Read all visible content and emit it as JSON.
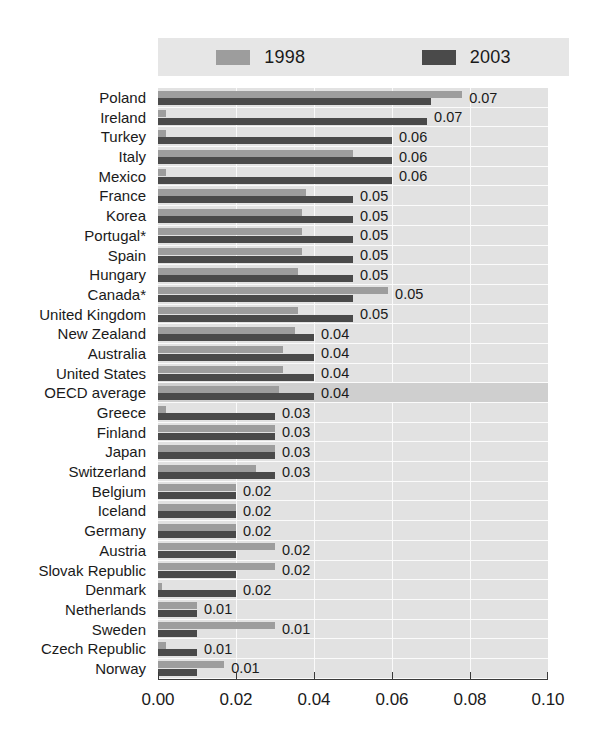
{
  "legend": {
    "entries": [
      {
        "label": "1998",
        "color": "#9d9d9d",
        "icon": "legend-swatch-icon"
      },
      {
        "label": "2003",
        "color": "#4a4a4a",
        "icon": "legend-swatch-icon"
      }
    ]
  },
  "axis": {
    "tick_labels": [
      "0.00",
      "0.02",
      "0.04",
      "0.06",
      "0.08",
      "0.10"
    ]
  },
  "chart_data": {
    "type": "bar",
    "orientation": "horizontal",
    "title": "",
    "subtitle": "",
    "xlabel": "",
    "ylabel": "",
    "xlim": [
      0.0,
      0.1
    ],
    "grid": true,
    "gridlines_at": [
      0.02,
      0.04,
      0.06,
      0.08
    ],
    "legend_position": "top",
    "highlight_category": "OECD average",
    "categories": [
      "Poland",
      "Ireland",
      "Turkey",
      "Italy",
      "Mexico",
      "France",
      "Korea",
      "Portugal*",
      "Spain",
      "Hungary",
      "Canada*",
      "United Kingdom",
      "New Zealand",
      "Australia",
      "United States",
      "OECD average",
      "Greece",
      "Finland",
      "Japan",
      "Switzerland",
      "Belgium",
      "Iceland",
      "Germany",
      "Austria",
      "Slovak Republic",
      "Denmark",
      "Netherlands",
      "Sweden",
      "Czech Republic",
      "Norway"
    ],
    "series": [
      {
        "name": "1998",
        "color": "#9d9d9d",
        "values": [
          0.078,
          0.002,
          0.002,
          0.05,
          0.002,
          0.038,
          0.037,
          0.037,
          0.037,
          0.036,
          0.059,
          0.036,
          0.035,
          0.032,
          0.032,
          0.031,
          0.002,
          0.03,
          0.03,
          0.025,
          0.02,
          0.02,
          0.02,
          0.03,
          0.03,
          0.001,
          0.01,
          0.03,
          0.002,
          0.017
        ]
      },
      {
        "name": "2003",
        "color": "#4a4a4a",
        "values": [
          0.07,
          0.069,
          0.06,
          0.06,
          0.06,
          0.05,
          0.05,
          0.05,
          0.05,
          0.05,
          0.05,
          0.05,
          0.04,
          0.04,
          0.04,
          0.04,
          0.03,
          0.03,
          0.03,
          0.03,
          0.02,
          0.02,
          0.02,
          0.02,
          0.02,
          0.02,
          0.01,
          0.01,
          0.01,
          0.01
        ]
      }
    ],
    "data_labels": [
      "0.07",
      "0.07",
      "0.06",
      "0.06",
      "0.06",
      "0.05",
      "0.05",
      "0.05",
      "0.05",
      "0.05",
      "0.05",
      "0.05",
      "0.04",
      "0.04",
      "0.04",
      "0.04",
      "0.03",
      "0.03",
      "0.03",
      "0.03",
      "0.02",
      "0.02",
      "0.02",
      "0.02",
      "0.02",
      "0.02",
      "0.01",
      "0.01",
      "0.01",
      "0.01"
    ]
  }
}
